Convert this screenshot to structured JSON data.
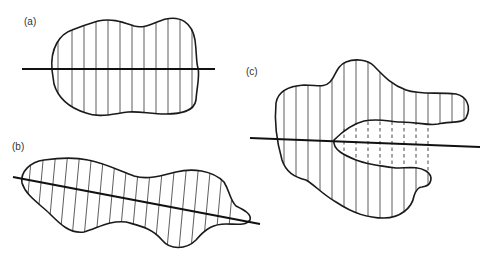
{
  "figure": {
    "panels": [
      {
        "id": "a",
        "label": "(a)",
        "description": "Convex blob hatched with vertical chords bisected by a horizontal axis line"
      },
      {
        "id": "b",
        "label": "(b)",
        "description": "Elongated blob hatched with slanted chords bisected by an inclined axis line"
      },
      {
        "id": "c",
        "label": "(c)",
        "description": "Non-convex blob with an indentation; solid chords outside, dashed chords crossing the cavity; horizontal axis line"
      }
    ],
    "colors": {
      "stroke": "#1a1a1a",
      "background": "#ffffff"
    }
  }
}
